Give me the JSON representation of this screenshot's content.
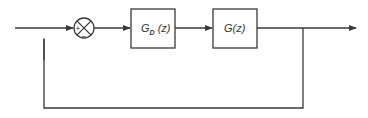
{
  "diagram": {
    "type": "feedback-control-block-diagram",
    "summing_junction": {
      "plus_sign": "+",
      "minus_sign": "−"
    },
    "blocks": [
      {
        "id": "controller",
        "main": "G",
        "subscript": "D",
        "arg": " (z)"
      },
      {
        "id": "plant",
        "main": "G",
        "subscript": "",
        "arg": "(z)"
      }
    ],
    "colors": {
      "line": "#3a3a3a",
      "background": "#ffffff"
    }
  }
}
